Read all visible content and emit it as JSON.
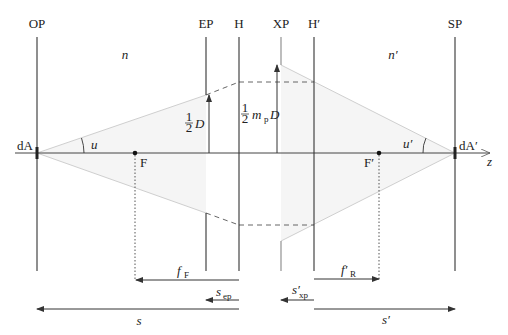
{
  "planes": [
    {
      "id": "OP",
      "label": "OP",
      "x": 37
    },
    {
      "id": "EP",
      "label": "EP",
      "x": 206
    },
    {
      "id": "H",
      "label": "H",
      "x": 239
    },
    {
      "id": "XP",
      "label": "XP",
      "x": 281
    },
    {
      "id": "H_prime",
      "label": "H′",
      "x": 314
    },
    {
      "id": "SP",
      "label": "SP",
      "x": 455
    }
  ],
  "media": {
    "object_space": "n",
    "image_space": "n′"
  },
  "axis": {
    "label": "z",
    "y": 153
  },
  "points": {
    "object_element": "dA",
    "image_element": "dA′",
    "front_focus": "F",
    "rear_focus": "F′"
  },
  "angles": {
    "object": "u",
    "image": "u′"
  },
  "heights": {
    "entrance_pupil": {
      "frac": "1",
      "den": "2",
      "var": "D"
    },
    "exit_pupil": {
      "frac": "1",
      "den": "2",
      "var": "m",
      "var_sub": "p",
      "var2": "D"
    }
  },
  "distances": {
    "f_F": {
      "main": "f",
      "sub": "F"
    },
    "f_R": {
      "main": "f′",
      "sub": "R"
    },
    "s_ep": {
      "main": "s",
      "sub": "ep"
    },
    "s_xp": {
      "main": "s′",
      "sub": "xp"
    },
    "s": {
      "main": "s"
    },
    "s_prime": {
      "main": "s′"
    }
  },
  "colors": {
    "line": "#333333",
    "ray": "#c8c8c8",
    "fill": "#f3f3f3",
    "dash": "#555555"
  }
}
